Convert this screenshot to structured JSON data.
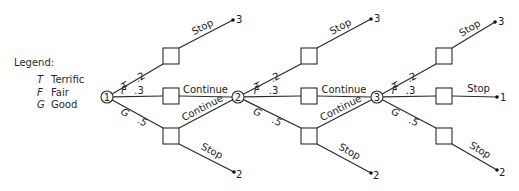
{
  "legend": {
    "title": "Legend:",
    "items": [
      {
        "key": "T",
        "label": "Terrific"
      },
      {
        "key": "F",
        "label": "Fair"
      },
      {
        "key": "G",
        "label": "Good"
      }
    ]
  },
  "colors": {
    "line": "#2b2b2b",
    "text": "#222222",
    "background": "#ffffff"
  },
  "tree": {
    "stages": [
      {
        "chance_node": {
          "label": "1",
          "cx": 107,
          "cy": 97
        },
        "box_x": 163,
        "branches": [
          {
            "key": "T",
            "prob": ".2",
            "box_y": 48,
            "action": "Stop",
            "end": {
              "x": 233,
              "y": 20,
              "value": "3"
            }
          },
          {
            "key": "F",
            "prob": ".3",
            "box_y": 88,
            "action": "Continue",
            "end": null
          },
          {
            "key": "G",
            "prob": ".5",
            "box_y": 128,
            "action_stop": "Stop",
            "action_continue": "Continue",
            "end": {
              "x": 234,
              "y": 172,
              "value": "2"
            }
          }
        ]
      },
      {
        "chance_node": {
          "label": "2",
          "cx": 238,
          "cy": 97
        },
        "box_x": 301,
        "branches": [
          {
            "key": "T",
            "prob": ".2",
            "box_y": 48,
            "action": "Stop",
            "end": {
              "x": 371,
              "y": 19,
              "value": "3"
            }
          },
          {
            "key": "F",
            "prob": ".3",
            "box_y": 88,
            "action": "Continue",
            "end": null
          },
          {
            "key": "G",
            "prob": ".5",
            "box_y": 128,
            "action_stop": "Stop",
            "action_continue": "Continue",
            "end": {
              "x": 371,
              "y": 173,
              "value": "2"
            }
          }
        ]
      },
      {
        "chance_node": {
          "label": "3",
          "cx": 377,
          "cy": 97
        },
        "box_x": 436,
        "branches": [
          {
            "key": "T",
            "prob": ".2",
            "box_y": 48,
            "action": "Stop",
            "end": {
              "x": 495,
              "y": 22,
              "value": "3"
            }
          },
          {
            "key": "F",
            "prob": ".3",
            "box_y": 88,
            "action": "Stop",
            "end": {
              "x": 497,
              "y": 97,
              "value": "1"
            }
          },
          {
            "key": "G",
            "prob": ".5",
            "box_y": 128,
            "action": "Stop",
            "end": {
              "x": 497,
              "y": 170,
              "value": "2"
            }
          }
        ]
      }
    ],
    "box_size": 16
  }
}
